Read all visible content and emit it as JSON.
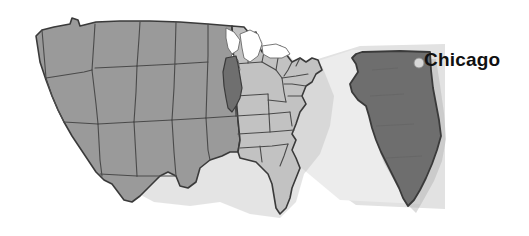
{
  "figure": {
    "type": "map-illustration",
    "background_color": "#ffffff"
  },
  "labels": {
    "city": "Chicago"
  },
  "markers": {
    "city_dot_name": "city-dot-marker",
    "city_dot_color": "#d8d8d8"
  },
  "colors": {
    "west_states_fill": "#9a9a9a",
    "east_states_fill": "#c2c2c2",
    "highlight_state_fill": "#6f6f6f",
    "inset_state_fill": "#6e6e6e",
    "border_stroke": "#4a4a4a",
    "outline_stroke": "#3a3a3a",
    "spotlight_fill": "#e2e2e2",
    "lake_fill": "#ffffff",
    "shadow_fill": "#b5b5b5",
    "label_color": "#111111"
  },
  "regions": {
    "highlighted_state": "Illinois",
    "inset_state": "Illinois",
    "spotlight_name": "illinois-spotlight-wedge"
  },
  "icons": {
    "city_dot": "circle-marker-icon"
  }
}
